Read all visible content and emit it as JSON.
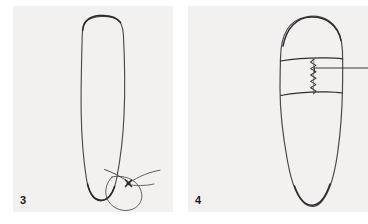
{
  "figure": {
    "background_color": "#ffffff",
    "panel_background_color": "#f2f1f0",
    "ink_color": "#3a3a3c",
    "label_color": "#1a1a1a",
    "panels": [
      {
        "label": "3",
        "caption_number": "3",
        "subject": "tooth-root-outline-with-suture-loop",
        "elements": [
          "tooth-outline",
          "suture-thread-loop",
          "suture-knot",
          "thread-tail"
        ]
      },
      {
        "label": "4",
        "caption_number": "4",
        "subject": "tooth-root-outline-with-banded-collar",
        "elements": [
          "tooth-outline",
          "collar-band-upper-line",
          "collar-band-lower-line",
          "zigzag-seam",
          "leader-line"
        ]
      }
    ]
  }
}
